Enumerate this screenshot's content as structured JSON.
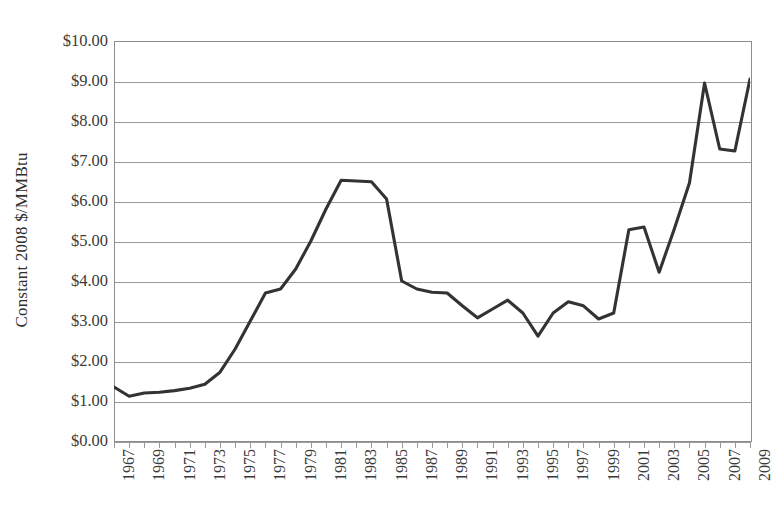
{
  "chart_data": {
    "type": "line",
    "title": "",
    "xlabel": "",
    "ylabel": "Constant 2008 $/MMBtu",
    "xlim": [
      1967,
      2009
    ],
    "ylim": [
      0,
      10
    ],
    "grid": true,
    "legend": false,
    "line_color": "#333333",
    "axis_color": "#8d8d8d",
    "y_tick_labels": [
      "$10.00",
      "$9.00",
      "$8.00",
      "$7.00",
      "$6.00",
      "$5.00",
      "$4.00",
      "$3.00",
      "$2.00",
      "$1.00",
      "$0.00"
    ],
    "y_tick_values": [
      10,
      9,
      8,
      7,
      6,
      5,
      4,
      3,
      2,
      1,
      0
    ],
    "x_tick_labels": [
      "1967",
      "1969",
      "1971",
      "1973",
      "1975",
      "1977",
      "1979",
      "1981",
      "1983",
      "1985",
      "1987",
      "1989",
      "1991",
      "1993",
      "1995",
      "1997",
      "1999",
      "2001",
      "2003",
      "2005",
      "2007",
      "2009"
    ],
    "x": [
      1967,
      1968,
      1969,
      1970,
      1971,
      1972,
      1973,
      1974,
      1975,
      1976,
      1977,
      1978,
      1979,
      1980,
      1981,
      1982,
      1983,
      1984,
      1985,
      1986,
      1987,
      1988,
      1989,
      1990,
      1991,
      1992,
      1993,
      1994,
      1995,
      1996,
      1997,
      1998,
      1999,
      2000,
      2001,
      2002,
      2003,
      2004,
      2005,
      2006,
      2007,
      2008,
      2009
    ],
    "values": [
      1.35,
      1.12,
      1.2,
      1.22,
      1.26,
      1.32,
      1.42,
      1.72,
      2.3,
      3.0,
      3.7,
      3.8,
      4.3,
      5.0,
      5.8,
      6.52,
      6.5,
      6.48,
      6.05,
      4.0,
      3.8,
      3.72,
      3.7,
      3.38,
      3.08,
      3.3,
      3.52,
      3.2,
      2.62,
      3.2,
      3.48,
      3.38,
      3.05,
      3.2,
      5.28,
      5.35,
      4.22,
      5.3,
      6.45,
      8.95,
      7.3,
      7.25,
      9.05
    ],
    "series_note": "U.S. natural gas price, constant 2008 dollars per MMBtu, 1967-2009"
  },
  "accessibility": {
    "chart_name": "constant-2008-dollars-per-mmbtu-line-chart"
  }
}
